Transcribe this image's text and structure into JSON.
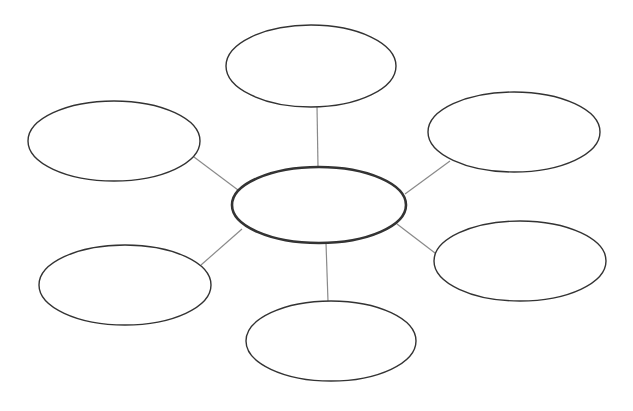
{
  "diagram": {
    "type": "bubble-map",
    "background": "#ffffff",
    "stroke_color": "#333333",
    "connector_color": "#8a8a8a",
    "center": {
      "id": "center",
      "label": "",
      "cx": 319,
      "cy": 205,
      "rx": 87,
      "ry": 38,
      "stroke_width": 2.6
    },
    "nodes": [
      {
        "id": "top",
        "label": "",
        "cx": 311,
        "cy": 66,
        "rx": 85,
        "ry": 41,
        "stroke_width": 1.4,
        "line": [
          317,
          106,
          318,
          167
        ]
      },
      {
        "id": "upper-left",
        "label": "",
        "cx": 114,
        "cy": 141,
        "rx": 86,
        "ry": 40,
        "stroke_width": 1.4,
        "line": [
          194,
          157,
          238,
          190
        ]
      },
      {
        "id": "upper-right",
        "label": "",
        "cx": 514,
        "cy": 132,
        "rx": 86,
        "ry": 40,
        "stroke_width": 1.4,
        "line": [
          450,
          161,
          405,
          194
        ]
      },
      {
        "id": "lower-left",
        "label": "",
        "cx": 125,
        "cy": 285,
        "rx": 86,
        "ry": 40,
        "stroke_width": 1.4,
        "line": [
          242,
          229,
          201,
          265
        ]
      },
      {
        "id": "lower-right",
        "label": "",
        "cx": 520,
        "cy": 261,
        "rx": 86,
        "ry": 40,
        "stroke_width": 1.4,
        "line": [
          397,
          224,
          435,
          253
        ]
      },
      {
        "id": "bottom",
        "label": "",
        "cx": 331,
        "cy": 341,
        "rx": 85,
        "ry": 40,
        "stroke_width": 1.4,
        "line": [
          326,
          243,
          328,
          301
        ]
      }
    ]
  }
}
